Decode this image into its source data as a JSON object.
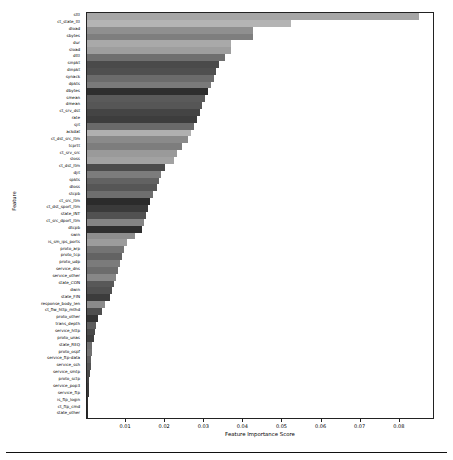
{
  "chart_data": {
    "type": "bar",
    "orientation": "horizontal",
    "title": "",
    "xlabel": "Feature Importance Score",
    "ylabel": "Feature",
    "xlim": [
      0,
      0.0885
    ],
    "grid": false,
    "legend": null,
    "xticks": [
      0.01,
      0.02,
      0.03,
      0.04,
      0.05,
      0.06,
      0.07,
      0.08
    ],
    "xtick_labels": [
      "0.01",
      "0.02",
      "0.03",
      "0.04",
      "0.05",
      "0.06",
      "0.07",
      "0.08"
    ],
    "categories": [
      "sttl",
      "ct_state_ttl",
      "dload",
      "sbytes",
      "dur",
      "sload",
      "dttl",
      "sinpkt",
      "dinpkt",
      "synack",
      "dpkts",
      "dbytes",
      "smean",
      "dmean",
      "ct_srv_dst",
      "rate",
      "sjit",
      "ackdat",
      "ct_dst_src_ltm",
      "tcprtt",
      "ct_srv_src",
      "sloss",
      "ct_dst_ltm",
      "djit",
      "spkts",
      "dloss",
      "stcpb",
      "ct_src_ltm",
      "ct_dst_sport_ltm",
      "state_INT",
      "ct_src_dport_ltm",
      "dtcpb",
      "swin",
      "is_sm_ips_ports",
      "proto_arp",
      "proto_tcp",
      "proto_udp",
      "service_dns",
      "service_other",
      "state_CON",
      "dwin",
      "state_FIN",
      "response_body_len",
      "ct_flw_http_mthd",
      "proto_other",
      "trans_depth",
      "service_http",
      "proto_unas",
      "state_REQ",
      "proto_ospf",
      "service_ftp-data",
      "service_ssh",
      "service_smtp",
      "proto_sctp",
      "service_pop3",
      "service_ftp",
      "is_ftp_login",
      "ct_ftp_cmd",
      "state_other"
    ],
    "values": [
      0.0849,
      0.0522,
      0.0424,
      0.0424,
      0.0368,
      0.0368,
      0.0353,
      0.0338,
      0.0331,
      0.0324,
      0.0317,
      0.031,
      0.0302,
      0.0295,
      0.0288,
      0.0281,
      0.0273,
      0.0266,
      0.0259,
      0.0244,
      0.0229,
      0.0222,
      0.02,
      0.019,
      0.0183,
      0.0178,
      0.0168,
      0.0161,
      0.0156,
      0.0151,
      0.0146,
      0.0141,
      0.0122,
      0.0102,
      0.0095,
      0.009,
      0.0085,
      0.008,
      0.0075,
      0.007,
      0.0063,
      0.0058,
      0.0046,
      0.0039,
      0.0029,
      0.0024,
      0.002,
      0.0017,
      0.0014,
      0.0012,
      0.001,
      0.0009,
      0.0007,
      0.0006,
      0.0005,
      0.0004,
      0.0003,
      0.0002,
      0.0001
    ],
    "bar_colors": [
      "#a6a6a6",
      "#b4b4b4",
      "#8f8f8f",
      "#7e7e7e",
      "#a9a9a9",
      "#9e9e9e",
      "#6f6f6f",
      "#4a4a4a",
      "#4f4f4f",
      "#6b6b6b",
      "#7a7a7a",
      "#2e2e2e",
      "#5a5a5a",
      "#565656",
      "#444444",
      "#3d3d3d",
      "#6a6a6a",
      "#b0b0b0",
      "#8a8a8a",
      "#7d7d7d",
      "#9a9a9a",
      "#a2a2a2",
      "#4b4b4b",
      "#7c7c7c",
      "#626262",
      "#565656",
      "#6e6e6e",
      "#2b2b2b",
      "#3a3a3a",
      "#515151",
      "#848484",
      "#2f2f2f",
      "#8e8e8e",
      "#9c9c9c",
      "#747474",
      "#636363",
      "#7b7b7b",
      "#6c6c6c",
      "#878787",
      "#585858",
      "#505050",
      "#3c3c3c",
      "#8b8b8b",
      "#4e4e4e",
      "#333333",
      "#5d5d5d",
      "#494949",
      "#3f3f3f",
      "#6d6d6d",
      "#727272",
      "#5f5f5f",
      "#545454",
      "#474747",
      "#414141",
      "#3b3b3b",
      "#353535",
      "#303030",
      "#2c2c2c",
      "#282828"
    ]
  },
  "axis": {
    "x_title": "Feature Importance Score",
    "y_title": "Feature"
  }
}
